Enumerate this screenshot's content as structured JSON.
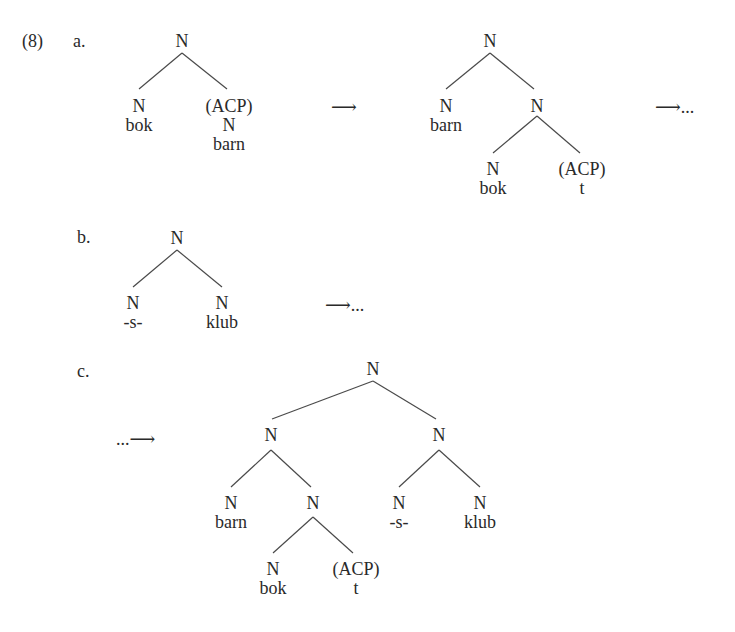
{
  "example": {
    "number": "(8)",
    "a": {
      "label": "a.",
      "tree1": {
        "root": "N",
        "left": {
          "cat": "N",
          "word": "bok"
        },
        "right": {
          "cat": "(ACP)",
          "cat2": "N",
          "word": "barn"
        }
      },
      "arrow1": "⟶",
      "tree2": {
        "root": "N",
        "left": {
          "cat": "N",
          "word": "barn"
        },
        "right": {
          "cat": "N",
          "left": {
            "cat": "N",
            "word": "bok"
          },
          "right": {
            "cat": "(ACP)",
            "word": "t"
          }
        }
      },
      "arrow2": "⟶..."
    },
    "b": {
      "label": "b.",
      "tree": {
        "root": "N",
        "left": {
          "cat": "N",
          "word": "-s-"
        },
        "right": {
          "cat": "N",
          "word": "klub"
        }
      },
      "arrow": "⟶..."
    },
    "c": {
      "label": "c.",
      "arrow": "...⟶",
      "tree": {
        "root": "N",
        "left": {
          "cat": "N",
          "left": {
            "cat": "N",
            "word": "barn"
          },
          "right": {
            "cat": "N",
            "left": {
              "cat": "N",
              "word": "bok"
            },
            "right": {
              "cat": "(ACP)",
              "word": "t"
            }
          }
        },
        "right": {
          "cat": "N",
          "left": {
            "cat": "N",
            "word": "-s-"
          },
          "right": {
            "cat": "N",
            "word": "klub"
          }
        }
      }
    }
  }
}
